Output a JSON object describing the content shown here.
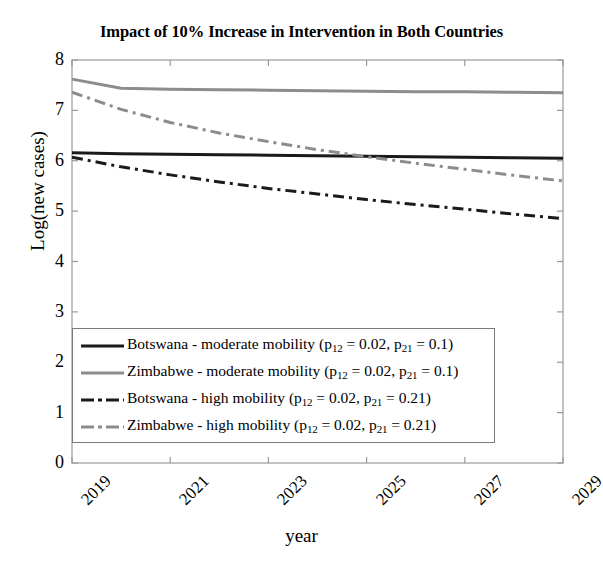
{
  "chart_data": {
    "type": "line",
    "title": "Impact of 10% Increase in Intervention in Both Countries",
    "xlabel": "year",
    "ylabel": "Log(new cases)",
    "xlim": [
      2019,
      2029
    ],
    "ylim": [
      0,
      8
    ],
    "xticks": [
      "2019",
      "2021",
      "2023",
      "2025",
      "2027",
      "2029"
    ],
    "xtick_values": [
      2019,
      2021,
      2023,
      2025,
      2027,
      2029
    ],
    "yticks": [
      "0",
      "1",
      "2",
      "3",
      "4",
      "5",
      "6",
      "7",
      "8"
    ],
    "ytick_values": [
      0,
      1,
      2,
      3,
      4,
      5,
      6,
      7,
      8
    ],
    "grid": false,
    "legend_position": "lower left",
    "x": [
      2019,
      2020,
      2021,
      2022,
      2023,
      2024,
      2025,
      2026,
      2027,
      2028,
      2029
    ],
    "series": [
      {
        "name": "Botswana - moderate mobility (p12 = 0.02, p21 = 0.1)",
        "label_parts": {
          "country": "Botswana",
          "mobility": "moderate mobility",
          "p12": "0.02",
          "p21": "0.1"
        },
        "color": "#1a1a1a",
        "style": "solid",
        "width": 3,
        "values": [
          6.16,
          6.14,
          6.13,
          6.12,
          6.11,
          6.1,
          6.09,
          6.08,
          6.07,
          6.06,
          6.05
        ]
      },
      {
        "name": "Zimbabwe - moderate mobility (p12 = 0.02, p21 = 0.1)",
        "label_parts": {
          "country": "Zimbabwe",
          "mobility": "moderate mobility",
          "p12": "0.02",
          "p21": "0.1"
        },
        "color": "#8c8c8c",
        "style": "solid",
        "width": 3,
        "values": [
          7.62,
          7.44,
          7.42,
          7.41,
          7.4,
          7.39,
          7.38,
          7.37,
          7.37,
          7.36,
          7.35
        ]
      },
      {
        "name": "Botswana - high mobility (p12 = 0.02, p21 = 0.21)",
        "label_parts": {
          "country": "Botswana",
          "mobility": "high mobility",
          "p12": "0.02",
          "p21": "0.21"
        },
        "color": "#1a1a1a",
        "style": "dashdot",
        "width": 3,
        "values": [
          6.07,
          5.88,
          5.72,
          5.58,
          5.45,
          5.34,
          5.23,
          5.13,
          5.04,
          4.94,
          4.85
        ]
      },
      {
        "name": "Zimbabwe - high mobility (p12 = 0.02, p21 = 0.21)",
        "label_parts": {
          "country": "Zimbabwe",
          "mobility": "high mobility",
          "p12": "0.02",
          "p21": "0.21"
        },
        "color": "#8c8c8c",
        "style": "dashdot",
        "width": 3,
        "values": [
          7.36,
          7.02,
          6.76,
          6.55,
          6.38,
          6.22,
          6.08,
          5.95,
          5.83,
          5.71,
          5.6
        ]
      }
    ]
  },
  "legend": {
    "items": [
      {
        "prefix": "Botswana - moderate mobility (p",
        "sub1": "12",
        "mid": " = 0.02, p",
        "sub2": "21",
        "suffix": " = 0.1)",
        "color": "#1a1a1a",
        "style": "solid"
      },
      {
        "prefix": "Zimbabwe - moderate mobility (p",
        "sub1": "12",
        "mid": " = 0.02, p",
        "sub2": "21",
        "suffix": " = 0.1)",
        "color": "#8c8c8c",
        "style": "solid"
      },
      {
        "prefix": "Botswana - high mobility (p",
        "sub1": "12",
        "mid": " = 0.02, p",
        "sub2": "21",
        "suffix": " = 0.21)",
        "color": "#1a1a1a",
        "style": "dashdot"
      },
      {
        "prefix": "Zimbabwe - high mobility (p",
        "sub1": "12",
        "mid": " = 0.02, p",
        "sub2": "21",
        "suffix": " = 0.21)",
        "color": "#8c8c8c",
        "style": "dashdot"
      }
    ]
  },
  "axis_frame": {
    "color": "#9a9a9a",
    "left": 72,
    "right": 563,
    "top": 60,
    "bottom": 463
  }
}
